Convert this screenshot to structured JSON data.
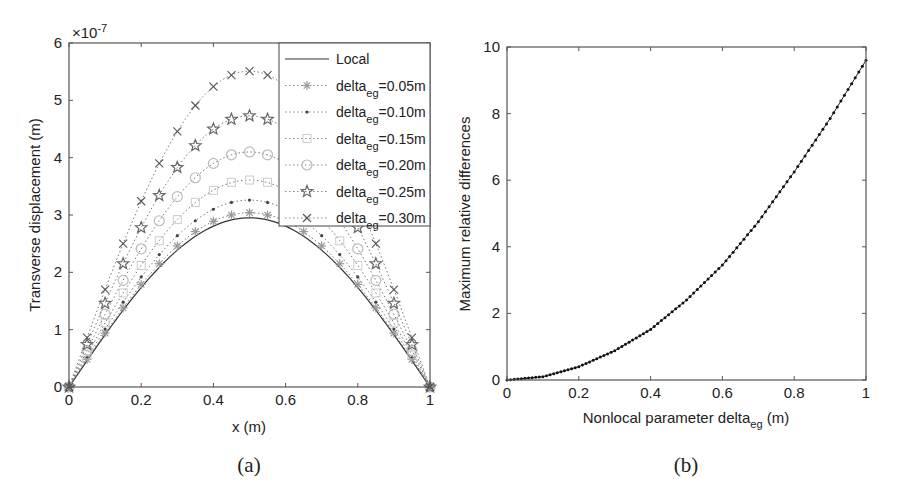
{
  "chart_data": [
    {
      "type": "line",
      "panel_label": "(a)",
      "title": "",
      "xlabel": "x (m)",
      "ylabel": "Transverse displacement (m)",
      "y_exponent_label": "×10",
      "y_exponent_power": "-7",
      "xlim": [
        0,
        1
      ],
      "ylim": [
        0,
        6
      ],
      "y_scale": 1e-07,
      "xticks": [
        0,
        0.2,
        0.4,
        0.6,
        0.8,
        1
      ],
      "xtick_labels": [
        "0",
        "0.2",
        "0.4",
        "0.6",
        "0.8",
        "1"
      ],
      "yticks": [
        0,
        1,
        2,
        3,
        4,
        5,
        6
      ],
      "ytick_labels": [
        "0",
        "1",
        "2",
        "3",
        "4",
        "5",
        "6"
      ],
      "grid": false,
      "legend_position": "upper right",
      "x": [
        0,
        0.05,
        0.1,
        0.15,
        0.2,
        0.25,
        0.3,
        0.35,
        0.4,
        0.45,
        0.5,
        0.55,
        0.6,
        0.65,
        0.7,
        0.75,
        0.8,
        0.85,
        0.9,
        0.95,
        1.0
      ],
      "series": [
        {
          "name": "Local",
          "legend_main": "Local",
          "legend_sub": "",
          "legend_tail": "",
          "peak": 2.95,
          "style": "solid",
          "marker": "none",
          "color": "#333333",
          "values": [
            0,
            0.46,
            0.91,
            1.34,
            1.73,
            2.09,
            2.39,
            2.63,
            2.81,
            2.91,
            2.95,
            2.91,
            2.81,
            2.63,
            2.39,
            2.09,
            1.73,
            1.34,
            0.91,
            0.46,
            0
          ]
        },
        {
          "name": "delta_eg=0.05m",
          "legend_main": "delta",
          "legend_sub": "eg",
          "legend_tail": "=0.05m",
          "peak": 3.04,
          "style": "dotted",
          "marker": "asterisk",
          "color": "#999999",
          "values": [
            0,
            0.48,
            0.94,
            1.38,
            1.79,
            2.15,
            2.46,
            2.71,
            2.89,
            3.0,
            3.04,
            3.0,
            2.89,
            2.71,
            2.46,
            2.15,
            1.79,
            1.38,
            0.94,
            0.48,
            0
          ]
        },
        {
          "name": "delta_eg=0.10m",
          "legend_main": "delta",
          "legend_sub": "eg",
          "legend_tail": "=0.10m",
          "peak": 3.26,
          "style": "dotted",
          "marker": "dot",
          "color": "#444444",
          "values": [
            0,
            0.51,
            1.01,
            1.48,
            1.92,
            2.31,
            2.64,
            2.9,
            3.1,
            3.22,
            3.26,
            3.22,
            3.1,
            2.9,
            2.64,
            2.31,
            1.92,
            1.48,
            1.01,
            0.51,
            0
          ]
        },
        {
          "name": "delta_eg=0.15m",
          "legend_main": "delta",
          "legend_sub": "eg",
          "legend_tail": "=0.15m",
          "peak": 3.61,
          "style": "dotted",
          "marker": "square",
          "color": "#cccccc",
          "values": [
            0,
            0.56,
            1.12,
            1.64,
            2.12,
            2.55,
            2.92,
            3.22,
            3.43,
            3.57,
            3.61,
            3.57,
            3.43,
            3.22,
            2.92,
            2.55,
            2.12,
            1.64,
            1.12,
            0.56,
            0
          ]
        },
        {
          "name": "delta_eg=0.20m",
          "legend_main": "delta",
          "legend_sub": "eg",
          "legend_tail": "=0.20m",
          "peak": 4.1,
          "style": "dotted",
          "marker": "circle",
          "color": "#bbbbbb",
          "values": [
            0,
            0.64,
            1.27,
            1.86,
            2.41,
            2.9,
            3.32,
            3.65,
            3.9,
            4.05,
            4.1,
            4.05,
            3.9,
            3.65,
            3.32,
            2.9,
            2.41,
            1.86,
            1.27,
            0.64,
            0
          ]
        },
        {
          "name": "delta_eg=0.25m",
          "legend_main": "delta",
          "legend_sub": "eg",
          "legend_tail": "=0.25m",
          "peak": 4.73,
          "style": "dotted",
          "marker": "star",
          "color": "#666666",
          "values": [
            0,
            0.74,
            1.46,
            2.15,
            2.78,
            3.34,
            3.83,
            4.21,
            4.5,
            4.67,
            4.73,
            4.67,
            4.5,
            4.21,
            3.83,
            3.34,
            2.78,
            2.15,
            1.46,
            0.74,
            0
          ]
        },
        {
          "name": "delta_eg=0.30m",
          "legend_main": "delta",
          "legend_sub": "eg",
          "legend_tail": "=0.30m",
          "peak": 5.51,
          "style": "dotted",
          "marker": "x",
          "color": "#555555",
          "values": [
            0,
            0.86,
            1.7,
            2.5,
            3.24,
            3.9,
            4.46,
            4.91,
            5.24,
            5.44,
            5.51,
            5.44,
            5.24,
            4.91,
            4.46,
            3.9,
            3.24,
            2.5,
            1.7,
            0.86,
            0
          ]
        }
      ]
    },
    {
      "type": "line",
      "panel_label": "(b)",
      "title": "",
      "xlabel_main": "Nonlocal parameter delta",
      "xlabel_sub": "eg",
      "xlabel_tail": " (m)",
      "ylabel": "Maximum relative differences",
      "xlim": [
        0,
        1
      ],
      "ylim": [
        0,
        10
      ],
      "xticks": [
        0,
        0.2,
        0.4,
        0.6,
        0.8,
        1
      ],
      "xtick_labels": [
        "0",
        "0.2",
        "0.4",
        "0.6",
        "0.8",
        "1"
      ],
      "yticks": [
        0,
        2,
        4,
        6,
        8,
        10
      ],
      "ytick_labels": [
        "0",
        "2",
        "4",
        "6",
        "8",
        "10"
      ],
      "grid": false,
      "x": [
        0,
        0.1,
        0.2,
        0.3,
        0.4,
        0.5,
        0.6,
        0.7,
        0.8,
        0.9,
        1.0
      ],
      "series": [
        {
          "name": "Maximum relative differences",
          "style": "dotted-dense",
          "marker": "dot",
          "color": "#111111",
          "values": [
            0,
            0.1,
            0.4,
            0.88,
            1.52,
            2.4,
            3.45,
            4.75,
            6.25,
            7.85,
            9.6
          ]
        }
      ]
    }
  ]
}
